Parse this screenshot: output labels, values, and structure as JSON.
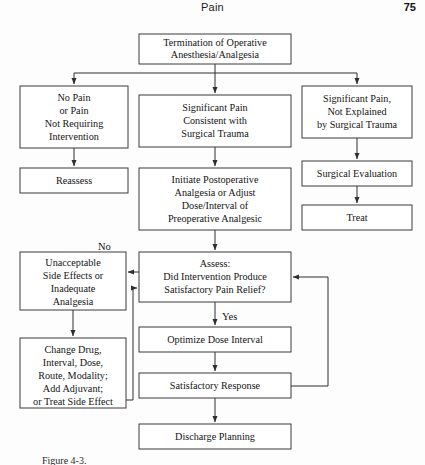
{
  "running_head": {
    "title": "Pain",
    "page_number": "75"
  },
  "figure": {
    "caption": "Figure 4-3.",
    "nodes": {
      "termination": {
        "id": "termination",
        "lines": [
          "Termination of Operative",
          "Anesthesia/Analgesia"
        ],
        "x": 139,
        "y": 34,
        "w": 152,
        "h": 30
      },
      "no_pain": {
        "id": "no-pain",
        "lines": [
          "No Pain",
          "or Pain",
          "Not Requiring",
          "Intervention"
        ],
        "x": 20,
        "y": 86,
        "w": 108,
        "h": 62
      },
      "reassess": {
        "id": "reassess",
        "lines": [
          "Reassess"
        ],
        "x": 20,
        "y": 168,
        "w": 108,
        "h": 25
      },
      "significant_pain_consistent": {
        "id": "significant-pain-consistent",
        "lines": [
          "Significant Pain",
          "Consistent with",
          "Surgical Trauma"
        ],
        "x": 139,
        "y": 95,
        "w": 152,
        "h": 52
      },
      "initiate_postoperative": {
        "id": "initiate-postoperative",
        "lines": [
          "Initiate Postoperative",
          "Analgesia or Adjust",
          "Dose/Interval of",
          "Preoperative Analgesic"
        ],
        "x": 139,
        "y": 168,
        "w": 152,
        "h": 62
      },
      "significant_pain_unexplained": {
        "id": "significant-pain-unexplained",
        "lines": [
          "Significant Pain,",
          "Not Explained",
          "by Surgical Trauma"
        ],
        "x": 302,
        "y": 86,
        "w": 110,
        "h": 52
      },
      "surgical_evaluation": {
        "id": "surgical-evaluation",
        "lines": [
          "Surgical Evaluation"
        ],
        "x": 302,
        "y": 161,
        "w": 110,
        "h": 25
      },
      "treat": {
        "id": "treat",
        "lines": [
          "Treat"
        ],
        "x": 302,
        "y": 205,
        "w": 110,
        "h": 25
      },
      "assess": {
        "id": "assess",
        "lines": [
          "Assess:",
          "Did Intervention Produce",
          "Satisfactory Pain Relief?"
        ],
        "x": 139,
        "y": 252,
        "w": 152,
        "h": 50
      },
      "unacceptable": {
        "id": "unacceptable-side-effects",
        "lines": [
          "Unacceptable",
          "Side Effects or",
          "Inadequate",
          "Analgesia"
        ],
        "x": 20,
        "y": 252,
        "w": 106,
        "h": 58
      },
      "change_drug": {
        "id": "change-drug",
        "lines": [
          "Change Drug,",
          "Interval, Dose,",
          "Route, Modality;",
          "Add Adjuvant;",
          "or Treat Side Effect"
        ],
        "x": 20,
        "y": 338,
        "w": 106,
        "h": 70
      },
      "optimize": {
        "id": "optimize-dose-interval",
        "lines": [
          "Optimize Dose Interval"
        ],
        "x": 139,
        "y": 327,
        "w": 152,
        "h": 25
      },
      "satisfactory_response": {
        "id": "satisfactory-response",
        "lines": [
          "Satisfactory Response"
        ],
        "x": 139,
        "y": 373,
        "w": 152,
        "h": 25
      },
      "discharge": {
        "id": "discharge-planning",
        "lines": [
          "Discharge Planning"
        ],
        "x": 139,
        "y": 424,
        "w": 152,
        "h": 25
      }
    },
    "edge_labels": {
      "no": {
        "text": "No",
        "x": 98,
        "y": 250
      },
      "yes": {
        "text": "Yes",
        "x": 222,
        "y": 318
      }
    }
  },
  "colors": {
    "box_stroke": "#3b3b3b",
    "connector": "#2e2e2e",
    "text": "#141414",
    "page_background": "#fdfdfd"
  }
}
